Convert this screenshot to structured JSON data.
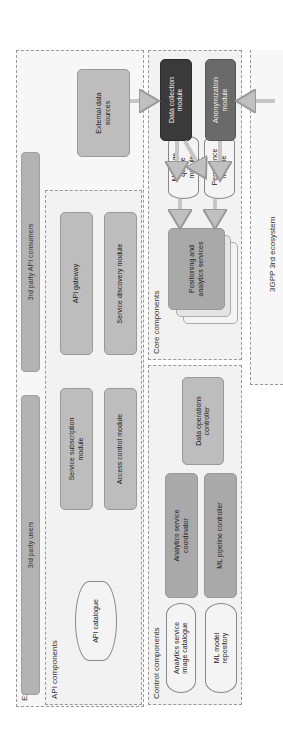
{
  "diagram": {
    "orientation": "rotated -90deg",
    "regions": {
      "external_environment": {
        "label": "External environment"
      },
      "api_components": {
        "label": "API components"
      },
      "control_components": {
        "label": "Control components"
      },
      "core_components": {
        "label": "Core components"
      },
      "gpp_ecosystem": {
        "label": "3GPP 3rd ecosystem"
      }
    },
    "external": {
      "users": "3rd party users",
      "api_consumers": "3rd party API consumers",
      "data_sources": "External data sources"
    },
    "api": {
      "catalogue": "API catalogue",
      "subscription": "Service subscription module",
      "access_control": "Access control module",
      "gateway": "API gateway",
      "discovery": "Service discovery module"
    },
    "control": {
      "image_catalogue": "Analytics service image catalogue",
      "ml_repository": "ML model repository",
      "coordinator": "Analytics service coordinator",
      "ml_pipeline": "ML pipeline controller",
      "data_ops": "Data operations controller"
    },
    "core": {
      "positioning": "Positioning and analytics services",
      "message_queue": "Message queue module",
      "persistence": "Persistence module",
      "data_collection": "Data collection module",
      "anonymization": "Anonymization module"
    },
    "colors": {
      "region_bg": "#f2f2f2",
      "box_gray": "#bdbdbd",
      "dark_box": "#3a3a3a",
      "arrow": "#c8c8c8"
    }
  }
}
